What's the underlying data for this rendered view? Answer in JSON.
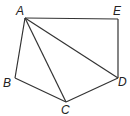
{
  "diagram": {
    "points": {
      "A": {
        "label": "A",
        "x": 25,
        "y": 18
      },
      "B": {
        "label": "B",
        "x": 15,
        "y": 78
      },
      "C": {
        "label": "C",
        "x": 66,
        "y": 102
      },
      "D": {
        "label": "D",
        "x": 118,
        "y": 78
      },
      "E": {
        "label": "E",
        "x": 118,
        "y": 19
      }
    },
    "segments": [
      [
        "A",
        "E"
      ],
      [
        "E",
        "D"
      ],
      [
        "D",
        "C"
      ],
      [
        "C",
        "B"
      ],
      [
        "B",
        "A"
      ],
      [
        "A",
        "C"
      ],
      [
        "A",
        "D"
      ]
    ]
  }
}
